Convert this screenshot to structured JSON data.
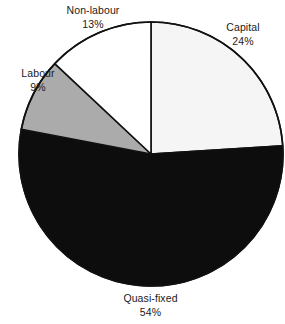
{
  "chart_data": {
    "type": "pie",
    "title": "",
    "subtitle": "",
    "xlabel": "",
    "ylabel": "",
    "legend_position": "none",
    "grid": false,
    "start_angle_deg": 0,
    "direction": "clockwise",
    "categories": [
      "Capital",
      "Quasi-fixed",
      "Labour",
      "Non-labour"
    ],
    "values": [
      24,
      54,
      9,
      13
    ],
    "value_unit": "%",
    "slices": [
      {
        "name": "Capital",
        "value": 24,
        "label": "Capital",
        "percent_label": "24%",
        "color": "#f5f5f5",
        "stroke": "#111111",
        "start_deg": 0,
        "end_deg": 86.4
      },
      {
        "name": "Quasi-fixed",
        "value": 54,
        "label": "Quasi-fixed",
        "percent_label": "54%",
        "color": "#0d0d0d",
        "stroke": "#111111",
        "start_deg": 86.4,
        "end_deg": 280.8
      },
      {
        "name": "Labour",
        "value": 9,
        "label": "Labour",
        "percent_label": "9%",
        "color": "#ababab",
        "stroke": "#111111",
        "start_deg": 280.8,
        "end_deg": 313.2
      },
      {
        "name": "Non-labour",
        "value": 13,
        "label": "Non-labour",
        "percent_label": "13%",
        "color": "#ffffff",
        "stroke": "#111111",
        "start_deg": 313.2,
        "end_deg": 360
      }
    ]
  },
  "geometry": {
    "center_x": 151,
    "center_y": 154,
    "radius": 132
  },
  "colors": {
    "background": "#ffffff",
    "outline": "#111111",
    "text": "#1a1a1a",
    "capital_fill": "#f5f5f5",
    "quasi_fixed_fill": "#0d0d0d",
    "labour_fill": "#ababab",
    "non_labour_fill": "#ffffff"
  },
  "labels": {
    "non_labour": {
      "name": "Non-labour",
      "percent": "13%"
    },
    "capital": {
      "name": "Capital",
      "percent": "24%"
    },
    "labour": {
      "name": "Labour",
      "percent": "9%"
    },
    "quasi_fixed": {
      "name": "Quasi-fixed",
      "percent": "54%"
    }
  }
}
